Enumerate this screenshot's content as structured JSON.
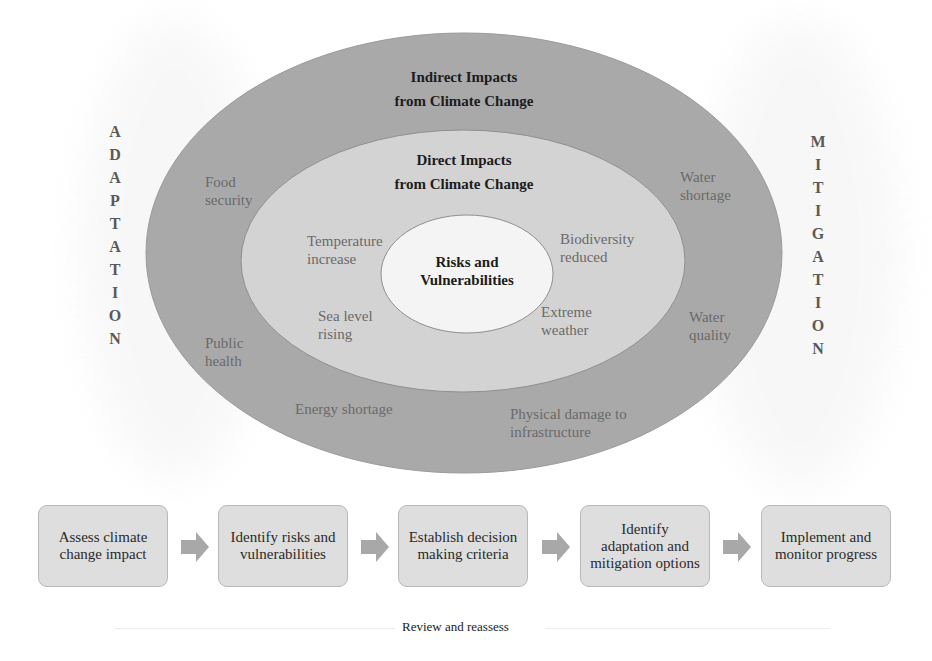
{
  "diagram": {
    "outer_ring": {
      "title_line1": "Indirect Impacts",
      "title_line2": "from Climate Change",
      "color": "#a9a9a9",
      "items": [
        {
          "line1": "Food",
          "line2": "security"
        },
        {
          "line1": "Water",
          "line2": "shortage"
        },
        {
          "line1": "Public",
          "line2": "health"
        },
        {
          "line1": "Water",
          "line2": "quality"
        },
        {
          "line1": "Energy shortage",
          "line2": ""
        },
        {
          "line1": "Physical damage to",
          "line2": "infrastructure"
        }
      ]
    },
    "middle_ring": {
      "title_line1": "Direct Impacts",
      "title_line2": "from Climate Change",
      "color": "#d3d3d3",
      "items": [
        {
          "line1": "Temperature",
          "line2": "increase"
        },
        {
          "line1": "Biodiversity",
          "line2": "reduced"
        },
        {
          "line1": "Sea level",
          "line2": "rising"
        },
        {
          "line1": "Extreme",
          "line2": "weather"
        }
      ]
    },
    "core": {
      "title_line1": "Risks and",
      "title_line2": "Vulnerabilities",
      "color": "#f4f4f4"
    },
    "side_labels": {
      "left": [
        "A",
        "D",
        "A",
        "P",
        "T",
        "A",
        "T",
        "I",
        "O",
        "N"
      ],
      "right": [
        "M",
        "I",
        "T",
        "I",
        "G",
        "A",
        "T",
        "I",
        "O",
        "N"
      ]
    }
  },
  "process_flow": {
    "steps": [
      {
        "line1": "Assess climate",
        "line2": "change impact",
        "line3": ""
      },
      {
        "line1": "Identify risks and",
        "line2": "vulnerabilities",
        "line3": ""
      },
      {
        "line1": "Establish decision",
        "line2": "making criteria",
        "line3": ""
      },
      {
        "line1": "Identify",
        "line2": "adaptation and",
        "line3": "mitigation options"
      },
      {
        "line1": "Implement and",
        "line2": "monitor progress",
        "line3": ""
      }
    ],
    "arrow_icon": "right-arrow-icon",
    "box_color": "#dedede",
    "arrow_color": "#a8a8a8",
    "loop_label": "Review and reassess"
  }
}
